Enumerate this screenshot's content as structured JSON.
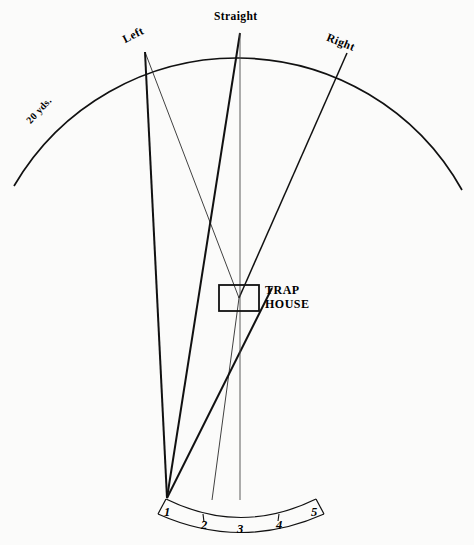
{
  "diagram": {
    "background_color": "#fbfbfa",
    "ink_color": "#111111"
  },
  "arc": {
    "distance_label": "20 yds.",
    "targets": [
      {
        "id": "left",
        "label": "Left",
        "x": 145,
        "y": 52,
        "rotation": -27
      },
      {
        "id": "straight",
        "label": "Straight",
        "x": 240,
        "y": 32,
        "rotation": 0
      },
      {
        "id": "right",
        "label": "Right",
        "x": 347,
        "y": 53,
        "rotation": 22
      }
    ]
  },
  "trap_house": {
    "label_line1": "TRAP",
    "label_line2": "HOUSE",
    "x": 219,
    "y": 285,
    "width": 40,
    "height": 26
  },
  "stations": {
    "items": [
      {
        "number": "1",
        "x": 168,
        "y": 515
      },
      {
        "number": "2",
        "x": 205,
        "y": 527
      },
      {
        "number": "3",
        "x": 241,
        "y": 531
      },
      {
        "number": "4",
        "x": 280,
        "y": 527
      },
      {
        "number": "5",
        "x": 314,
        "y": 515
      }
    ]
  },
  "flight_paths": [
    {
      "id": "house-to-left",
      "from": "trap-house",
      "to": "left",
      "weight": "thin"
    },
    {
      "id": "house-to-straight",
      "from": "trap-house",
      "to": "straight",
      "weight": "thin"
    },
    {
      "id": "house-to-right",
      "from": "trap-house",
      "to": "right",
      "weight": "med"
    },
    {
      "id": "station1-to-left",
      "from": "station-1",
      "to": "left",
      "weight": "thick"
    },
    {
      "id": "station1-to-straight",
      "from": "station-1",
      "to": "straight",
      "weight": "thick"
    },
    {
      "id": "station3-center",
      "from": "station-3",
      "to": "arc-apex",
      "weight": "center"
    }
  ]
}
